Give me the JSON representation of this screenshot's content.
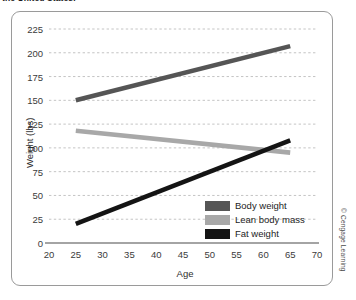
{
  "caption": {
    "text": "the United States."
  },
  "credit": {
    "text": "© Cengage Learning"
  },
  "chart_data": {
    "type": "line",
    "title": "",
    "xlabel": "Age",
    "ylabel": "Weight (lbs)",
    "xlim": [
      20,
      70
    ],
    "ylim": [
      0,
      225
    ],
    "xticks": [
      20,
      25,
      30,
      35,
      40,
      45,
      50,
      55,
      60,
      65,
      70
    ],
    "yticks": [
      0,
      25,
      50,
      75,
      100,
      125,
      150,
      175,
      200,
      225
    ],
    "grid": "horizontal-dashed",
    "legend_position": "lower-right-inside",
    "series": [
      {
        "name": "Body weight",
        "color": "#555555",
        "x": [
          25,
          65
        ],
        "values": [
          150,
          207
        ]
      },
      {
        "name": "Lean body mass",
        "color": "#a8a8a8",
        "x": [
          25,
          65
        ],
        "values": [
          118,
          95
        ]
      },
      {
        "name": "Fat weight",
        "color": "#141414",
        "x": [
          25,
          65
        ],
        "values": [
          20,
          108
        ]
      }
    ]
  }
}
